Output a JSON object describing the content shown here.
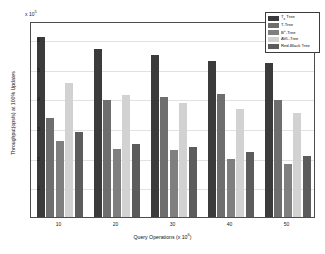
{
  "chart_data": {
    "type": "bar",
    "title": "",
    "xlabel": "Query Operations (x 10⁶)",
    "xlabel_base": "Query Operations (x 10",
    "xlabel_exp": "6",
    "xlabel_tail": ")",
    "ylabel": "Throughput(ops/s) at 100% Updates",
    "y_exponent_base": "x 10",
    "y_exponent_sup": "5",
    "categories": [
      "10",
      "20",
      "30",
      "40",
      "50"
    ],
    "yticks": [
      "1",
      "2",
      "3",
      "4",
      "5",
      "6"
    ],
    "ylim": [
      0,
      6.6
    ],
    "grid": true,
    "legend_position": "top-right",
    "series": [
      {
        "name": "Tₓ Tree",
        "name_base": "T",
        "name_sub": "x",
        "name_tail": " Tree",
        "color": "#3b3b3b",
        "values": [
          6.05,
          5.65,
          5.45,
          5.25,
          5.2
        ]
      },
      {
        "name": "T-Tree",
        "name_base": "T-Tree",
        "name_sub": "",
        "name_tail": "",
        "color": "#6e6e6e",
        "values": [
          3.35,
          3.95,
          4.05,
          4.15,
          3.95
        ]
      },
      {
        "name": "B⁺-Tree",
        "name_base": "B",
        "name_sub": "+",
        "name_tail": "-Tree",
        "color": "#7f7f7f",
        "values": [
          2.55,
          2.3,
          2.25,
          1.95,
          1.8
        ]
      },
      {
        "name": "AVL-Tree",
        "name_base": "AVL-Tree",
        "name_sub": "",
        "name_tail": "",
        "color": "#d2d2d2",
        "values": [
          4.5,
          4.1,
          3.85,
          3.65,
          3.5
        ]
      },
      {
        "name": "Red-Black Tree",
        "name_base": "Red-Black Tree",
        "name_sub": "",
        "name_tail": "",
        "color": "#5c5c5c",
        "values": [
          2.85,
          2.45,
          2.35,
          2.2,
          2.05
        ]
      }
    ]
  }
}
